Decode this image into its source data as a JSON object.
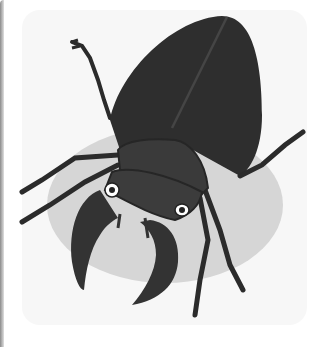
{
  "image": {
    "subject": "stag beetle illustration",
    "colors": {
      "background": "#ffffff",
      "card": "#f7f7f7",
      "shadow_ellipse": "#d6d6d6",
      "body_dark": "#2e2e2e",
      "head": "#3c3c3c",
      "eye_white": "#ffffff"
    }
  }
}
